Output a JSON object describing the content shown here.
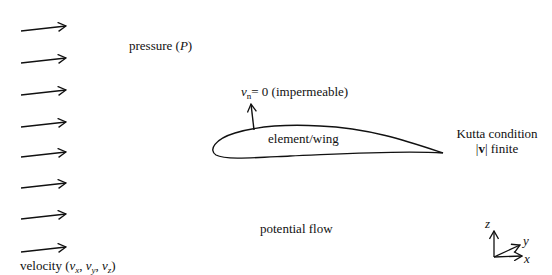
{
  "labels": {
    "pressure": "pressure (",
    "pressure_symbol": "P",
    "pressure_close": ")",
    "velocity_prefix": "velocity (",
    "velocity_v": "v",
    "velocity_sub_x": "x",
    "velocity_sub_y": "y",
    "velocity_sub_z": "z",
    "velocity_sep": ", ",
    "velocity_close": ")",
    "normal_v": "v",
    "normal_sub": "n",
    "normal_rest": "= 0 (impermeable)",
    "wing": "element/wing",
    "kutta_line1": "Kutta condition",
    "kutta_bar_left": "|",
    "kutta_v": "v",
    "kutta_bar_right": "|",
    "kutta_finite": " finite",
    "flow": "potential flow"
  },
  "axes": {
    "z": "z",
    "y": "y",
    "x": "x"
  },
  "inflow_arrows": {
    "count": 8,
    "description": "uniform free-stream velocity arrows"
  },
  "colors": {
    "ink": "#111111",
    "background": "#ffffff"
  }
}
